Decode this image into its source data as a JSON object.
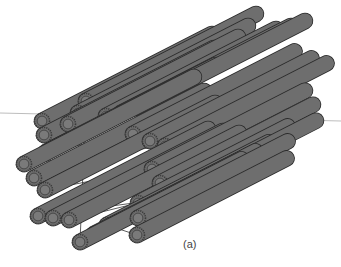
{
  "figure": {
    "caption": "(a)",
    "colors": {
      "tube_fill": "#6e6e6e",
      "tube_outline": "#2a2a2a",
      "ring": "#3a3a3a",
      "inner": "#7a7a7a",
      "reference_line": "#bdbdbd",
      "link": "#333333"
    },
    "reference_line": {
      "x1": 0,
      "y1": 113,
      "x2": 341,
      "y2": 121
    },
    "tube_direction": {
      "dx": 170,
      "dy": -87
    },
    "triplets": [
      {
        "name": "triplet-1",
        "ends": [
          [
            86,
            101
          ],
          [
            78,
            113
          ],
          [
            68,
            124
          ]
        ],
        "length": 1.0
      },
      {
        "name": "triplet-2",
        "ends": [
          [
            135,
            108
          ],
          [
            121,
            113
          ],
          [
            106,
            116
          ]
        ],
        "length": 1.0
      },
      {
        "name": "triplet-3",
        "ends": [
          [
            42,
            121
          ],
          [
            44,
            135
          ],
          [
            46,
            152
          ]
        ],
        "length": 1.0
      },
      {
        "name": "triplet-4",
        "ends": [
          [
            133,
            134
          ],
          [
            150,
            141
          ],
          [
            165,
            146
          ]
        ],
        "length": 0.95
      },
      {
        "name": "triplet-5",
        "ends": [
          [
            24,
            164
          ],
          [
            34,
            178
          ],
          [
            45,
            190
          ]
        ],
        "length": 1.0
      },
      {
        "name": "triplet-6",
        "ends": [
          [
            152,
            169
          ],
          [
            160,
            183
          ],
          [
            163,
            199
          ]
        ],
        "length": 0.9
      },
      {
        "name": "triplet-7",
        "ends": [
          [
            38,
            216
          ],
          [
            53,
            218
          ],
          [
            69,
            220
          ]
        ],
        "length": 1.0
      },
      {
        "name": "triplet-8",
        "ends": [
          [
            138,
            203
          ],
          [
            138,
            218
          ],
          [
            137,
            235
          ]
        ],
        "length": 0.88
      },
      {
        "name": "triplet-9",
        "ends": [
          [
            107,
            225
          ],
          [
            94,
            234
          ],
          [
            80,
            242
          ]
        ],
        "length": 0.95
      }
    ]
  }
}
